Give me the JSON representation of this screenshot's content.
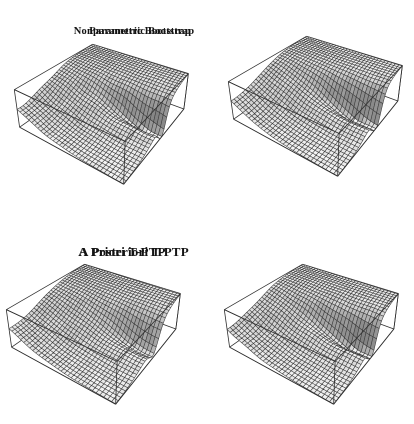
{
  "figure": {
    "background": "#ffffff",
    "panel_count": 4
  },
  "chart_data": {
    "type": "surface",
    "x_range": [
      0,
      1
    ],
    "y_range": [
      0,
      1
    ],
    "z_range": [
      0,
      1
    ],
    "grid": {
      "nx": 32,
      "ny": 32
    },
    "layout": {
      "camera": {
        "azimuth_deg": 215,
        "elevation_deg": 30,
        "distance": 2.6,
        "z_scale": 0.3
      },
      "screen": {
        "scale_x": 315,
        "scale_y": 365,
        "subplot_w": 207,
        "subplot_h": 212,
        "pixel_ratio": 2
      },
      "light": [
        0.35,
        0.25,
        0.9
      ],
      "colors": {
        "mesh_line": "#3a3a3a",
        "box_edge": "#2f2f2f",
        "background": "#ffffff"
      },
      "title_color": "#141414"
    },
    "subplots": [
      {
        "title": "Nonparametric Bootstrap",
        "origin": [
          0,
          0
        ],
        "box_offset": [
          105,
          100
        ],
        "title_center_x": 134,
        "title_top": 14,
        "title_font_px": 10.5,
        "surface": {
          "plateau_z": 1,
          "cliff": {
            "steepness": 9.0,
            "radius": 0.55,
            "y_weight": 0.55
          },
          "ravine": {
            "mouth_x": 0.56,
            "drift": -0.095,
            "width": 0.075,
            "depth": 0.56,
            "reach": 0.42
          },
          "ripple": {
            "amp": 0.02,
            "fx": 2.6,
            "fy": 3.1,
            "px": 0.1,
            "py": 0.6
          },
          "seed": 1
        }
      },
      {
        "title": "Parametric Bootstrap",
        "origin": [
          207,
          0
        ],
        "box_offset": [
          112,
          92
        ],
        "title_center_x": 140,
        "title_top": 14,
        "title_font_px": 10.5,
        "surface": {
          "plateau_z": 1,
          "cliff": {
            "steepness": 9.5,
            "radius": 0.55,
            "y_weight": 0.55
          },
          "ravine": {
            "mouth_x": 0.57,
            "drift": -0.095,
            "width": 0.085,
            "depth": 0.62,
            "reach": 0.45
          },
          "ripple": {
            "amp": 0.012,
            "fx": 2.2,
            "fy": 2.8,
            "px": 0.5,
            "py": 0.2
          },
          "seed": 2
        }
      },
      {
        "title": "A Priori T-PTP",
        "origin": [
          0,
          212
        ],
        "box_offset": [
          97,
          108
        ],
        "title_center_x": 122,
        "title_top": 231,
        "title_font_px": 13,
        "surface": {
          "plateau_z": 1,
          "cliff": {
            "steepness": 8.2,
            "radius": 0.55,
            "y_weight": 0.55
          },
          "ravine": {
            "mouth_x": 0.56,
            "drift": -0.09,
            "width": 0.1,
            "depth": 0.44,
            "reach": 0.38
          },
          "ripple": {
            "amp": 0.014,
            "fx": 2.4,
            "fy": 2.6,
            "px": 0.3,
            "py": 0.8
          },
          "seed": 3
        }
      },
      {
        "title": "A Posteriori T-PTP",
        "origin": [
          207,
          212
        ],
        "box_offset": [
          108,
          108
        ],
        "title_center_x": 134,
        "title_top": 231,
        "title_font_px": 13,
        "surface": {
          "plateau_z": 1,
          "cliff": {
            "steepness": 9.0,
            "radius": 0.55,
            "y_weight": 0.55
          },
          "ravine": {
            "mouth_x": 0.56,
            "drift": -0.095,
            "width": 0.08,
            "depth": 0.58,
            "reach": 0.44
          },
          "ripple": {
            "amp": 0.018,
            "fx": 2.7,
            "fy": 3.0,
            "px": 0.7,
            "py": 0.4
          },
          "seed": 4
        }
      }
    ]
  }
}
